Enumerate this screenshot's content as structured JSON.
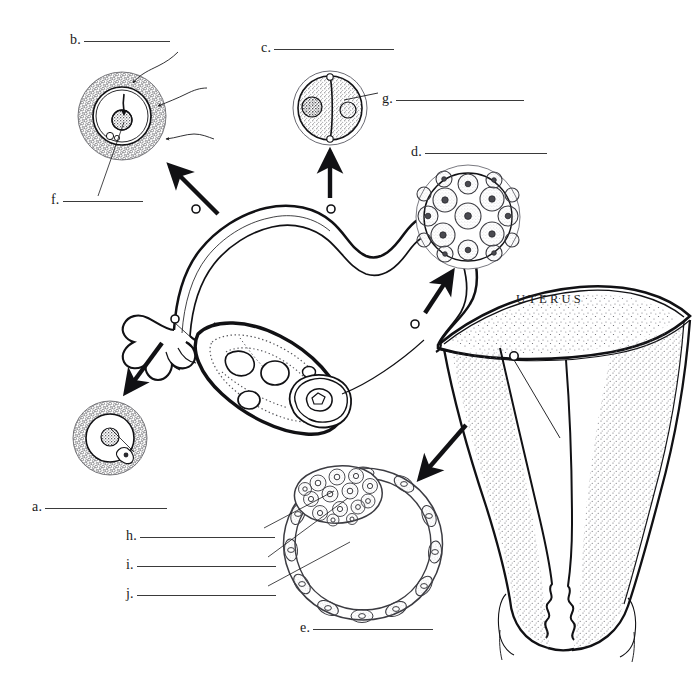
{
  "figure": {
    "background_color": "#ffffff",
    "ink_color": "#1a1a1a",
    "stipple_color": "#55555a"
  },
  "organ_labels": [
    {
      "name": "uterus-text",
      "text": "UTERUS",
      "x": 516,
      "y": 292
    }
  ],
  "answer_lines": [
    {
      "key": "b",
      "letter": "b.",
      "x": 70,
      "y": 32,
      "rule_width": 86
    },
    {
      "key": "c",
      "letter": "c.",
      "x": 261,
      "y": 40,
      "rule_width": 120
    },
    {
      "key": "g",
      "letter": "g.",
      "x": 382,
      "y": 91,
      "rule_width": 128
    },
    {
      "key": "d",
      "letter": "d.",
      "x": 411,
      "y": 144,
      "rule_width": 122
    },
    {
      "key": "f",
      "letter": "f.",
      "x": 51,
      "y": 192,
      "rule_width": 80
    },
    {
      "key": "a",
      "letter": "a.",
      "x": 32,
      "y": 499,
      "rule_width": 122
    },
    {
      "key": "h",
      "letter": "h.",
      "x": 126,
      "y": 528,
      "rule_width": 135
    },
    {
      "key": "i",
      "letter": "i.",
      "x": 126,
      "y": 557,
      "rule_width": 139
    },
    {
      "key": "j",
      "letter": "j.",
      "x": 126,
      "y": 586,
      "rule_width": 139
    },
    {
      "key": "e",
      "letter": "e.",
      "x": 300,
      "y": 620,
      "rule_width": 120
    }
  ],
  "structures": [
    {
      "name": "mature-graafian-follicle",
      "cx": 122,
      "cy": 116,
      "label_keys": [
        "b",
        "f"
      ]
    },
    {
      "name": "two-cell-zygote",
      "cx": 330,
      "cy": 108,
      "label_keys": [
        "c",
        "g"
      ]
    },
    {
      "name": "morula",
      "cx": 468,
      "cy": 217,
      "label_keys": [
        "d"
      ]
    },
    {
      "name": "ovulated-ovum",
      "cx": 110,
      "cy": 438,
      "label_keys": [
        "a"
      ]
    },
    {
      "name": "blastocyst",
      "cx": 363,
      "cy": 538,
      "label_keys": [
        "e",
        "h",
        "i",
        "j"
      ]
    },
    {
      "name": "ovary",
      "cx": 258,
      "cy": 375,
      "label_keys": []
    },
    {
      "name": "fallopian-tube",
      "cx": 320,
      "cy": 250,
      "label_keys": []
    },
    {
      "name": "uterus-body",
      "cx": 560,
      "cy": 330,
      "label_keys": []
    },
    {
      "name": "cervix-vagina",
      "cx": 556,
      "cy": 580,
      "label_keys": []
    }
  ]
}
